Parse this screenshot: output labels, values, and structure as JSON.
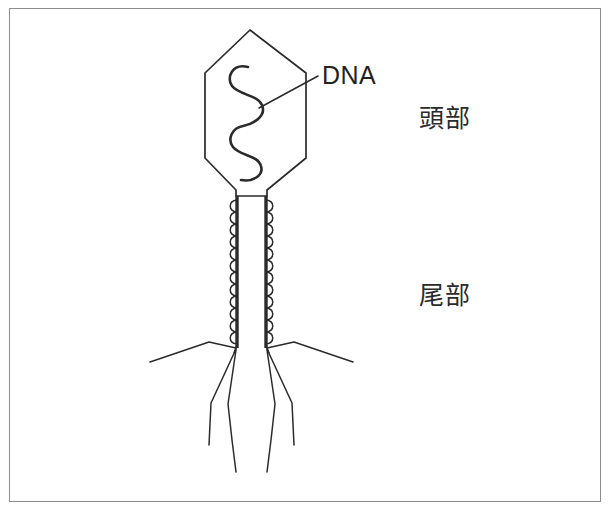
{
  "figure": {
    "border_color": "#8d8d8d",
    "background_color": "#ffffff",
    "ink_color": "#2b2b2b"
  },
  "labels": {
    "dna": "DNA",
    "head": "頭部",
    "tail": "尾部"
  },
  "diagram": {
    "head_name": "capsid-head",
    "dna_name": "dna-strand",
    "leader_name": "dna-leader-line",
    "sheath_name": "tail-sheath",
    "core_name": "tail-core",
    "baseplate_name": "base-plate",
    "fibers_name": "tail-fibers"
  }
}
